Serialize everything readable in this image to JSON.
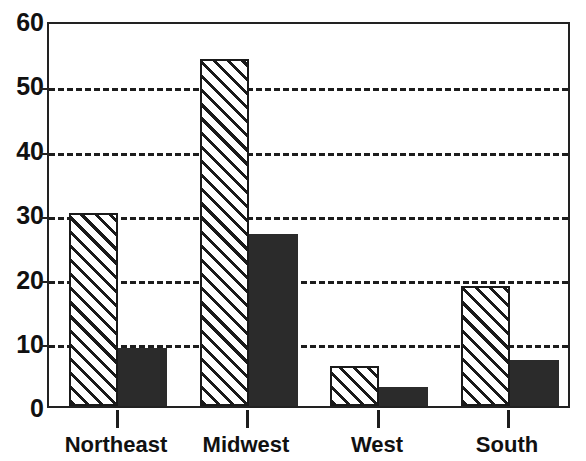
{
  "chart_data": {
    "type": "bar",
    "title": "",
    "title_note": "title cropped off at top edge of image",
    "xlabel": "",
    "ylabel": "",
    "categories": [
      "Northeast",
      "Midwest",
      "West",
      "South"
    ],
    "series": [
      {
        "name": "hatched-series",
        "pattern": "diagonal-hatch",
        "values": [
          30,
          54,
          6.2,
          18.7
        ]
      },
      {
        "name": "solid-series",
        "pattern": "solid-black",
        "values": [
          9,
          26.7,
          3,
          7.2
        ]
      }
    ],
    "ylim": [
      0,
      60
    ],
    "yticks": [
      0,
      10,
      20,
      30,
      40,
      50,
      60
    ],
    "ytick_labels": [
      "0",
      "10",
      "20",
      "30",
      "40",
      "50",
      "60"
    ],
    "grid": true,
    "grid_style": "dashed",
    "grid_values": [
      10,
      20,
      30,
      40,
      50
    ],
    "legend": null,
    "legend_position": "none",
    "colors": {
      "axis": "#222222",
      "grid": "#1d1d1d",
      "solid_bar": "#2b2b2b",
      "hatch_bar_fill": "#ffffff",
      "hatch_bar_line": "#1a1a1a",
      "background": "#ffffff",
      "text": "#111111"
    }
  },
  "axis": {
    "y_labels": [
      "60",
      "50",
      "40",
      "30",
      "20",
      "10",
      "0"
    ],
    "x_labels": [
      "Northeast",
      "Midwest",
      "West",
      "South"
    ]
  }
}
